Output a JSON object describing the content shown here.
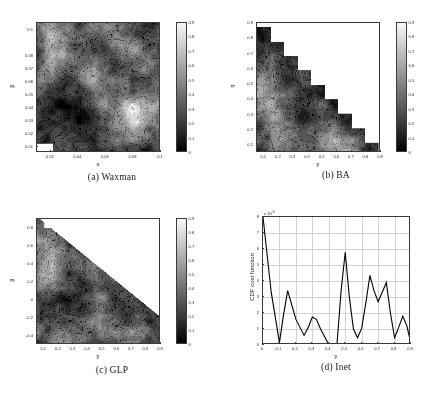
{
  "figure": {
    "panels": [
      {
        "id": "waxman",
        "caption": "(a) Waxman",
        "xlabel": "α",
        "ylabel": "β",
        "xticks": [
          "0.02",
          "0.04",
          "0.06",
          "0.08",
          "0.1"
        ],
        "xtick_values": [
          0.02,
          0.04,
          0.06,
          0.08,
          0.1
        ],
        "yticks": [
          "0.01",
          "0.02",
          "0.03",
          "0.04",
          "0.05",
          "0.06",
          "0.07",
          "0.08",
          "0.1"
        ],
        "ytick_values": [
          0.01,
          0.02,
          0.03,
          0.04,
          0.05,
          0.06,
          0.07,
          0.08,
          0.1
        ],
        "xlim": [
          0.01,
          0.1
        ],
        "ylim": [
          0.005,
          0.105
        ],
        "colorbar_ticks": [
          "0",
          "0.1",
          "0.2",
          "0.3",
          "0.4",
          "0.5",
          "0.6",
          "0.7",
          "0.8",
          "0.9"
        ],
        "colorbar_range": [
          0,
          0.9
        ]
      },
      {
        "id": "ba",
        "caption": "(b) BA",
        "xlabel": "p",
        "ylabel": "q",
        "xticks": [
          "0.1",
          "0.2",
          "0.3",
          "0.4",
          "0.5",
          "0.6",
          "0.7",
          "0.8",
          "0.9"
        ],
        "xtick_values": [
          0.1,
          0.2,
          0.3,
          0.4,
          0.5,
          0.6,
          0.7,
          0.8,
          0.9
        ],
        "yticks": [
          "0.1",
          "0.2",
          "0.3",
          "0.4",
          "0.5",
          "0.6",
          "0.7",
          "0.8",
          "0.9"
        ],
        "ytick_values": [
          0.1,
          0.2,
          0.3,
          0.4,
          0.5,
          0.6,
          0.7,
          0.8,
          0.9
        ],
        "xlim": [
          0.05,
          0.9
        ],
        "ylim": [
          0.05,
          0.9
        ],
        "colorbar_ticks": [
          "0",
          "0.1",
          "0.2",
          "0.3",
          "0.4",
          "0.5",
          "0.6",
          "0.7",
          "0.8",
          "0.9"
        ],
        "colorbar_range": [
          0,
          0.9
        ]
      },
      {
        "id": "glp",
        "caption": "(c) GLP",
        "xlabel": "p",
        "ylabel": "β",
        "xticks": [
          "0.1",
          "0.2",
          "0.3",
          "0.4",
          "0.5",
          "0.6",
          "0.7",
          "0.8",
          "0.9"
        ],
        "xtick_values": [
          0.1,
          0.2,
          0.3,
          0.4,
          0.5,
          0.6,
          0.7,
          0.8,
          0.9
        ],
        "yticks": [
          "0.8",
          "0.6",
          "0.4",
          "0.2",
          "0",
          "-0.2",
          "-0.4"
        ],
        "ytick_values": [
          0.8,
          0.6,
          0.4,
          0.2,
          0,
          -0.2,
          -0.4
        ],
        "xlim": [
          0.05,
          0.9
        ],
        "ylim": [
          -0.5,
          0.9
        ],
        "colorbar_ticks": [
          "0",
          "0.1",
          "0.2",
          "0.3",
          "0.4",
          "0.5",
          "0.6",
          "0.7",
          "0.8",
          "0.9"
        ],
        "colorbar_range": [
          0,
          0.9
        ]
      },
      {
        "id": "inet",
        "caption": "(d) Inet",
        "xlabel": "p",
        "ylabel": "CDF cost function",
        "exponent_prefix": "x 10",
        "exponent_power": "-3",
        "xticks": [
          "0",
          "0.1",
          "0.2",
          "0.3",
          "0.4",
          "0.5",
          "0.6",
          "0.7",
          "0.8",
          "0.9"
        ],
        "xtick_values": [
          0,
          0.1,
          0.2,
          0.3,
          0.4,
          0.5,
          0.6,
          0.7,
          0.8,
          0.9
        ],
        "yticks": [
          "0",
          "1",
          "2",
          "3",
          "4",
          "5",
          "6",
          "7",
          "8"
        ],
        "ytick_values": [
          0,
          1,
          2,
          3,
          4,
          5,
          6,
          7,
          8
        ],
        "xlim": [
          0,
          0.9
        ],
        "ylim": [
          0,
          8
        ]
      }
    ]
  },
  "chart_data": [
    {
      "type": "heatmap",
      "id": "waxman",
      "title": "(a) Waxman",
      "xlabel": "α",
      "ylabel": "β",
      "xlim": [
        0.01,
        0.1
      ],
      "ylim": [
        0.005,
        0.105
      ],
      "zlim": [
        0,
        0.9
      ],
      "grid": false,
      "legend": "colorbar-right",
      "x": [
        0.01,
        0.02,
        0.03,
        0.04,
        0.05,
        0.06,
        0.07,
        0.08,
        0.09,
        0.1
      ],
      "y": [
        0.01,
        0.02,
        0.03,
        0.04,
        0.05,
        0.06,
        0.07,
        0.08,
        0.09,
        0.1
      ],
      "z": [
        [
          0.05,
          0.18,
          0.3,
          0.22,
          0.16,
          0.24,
          0.4,
          0.3,
          0.2,
          0.28
        ],
        [
          0.2,
          0.28,
          0.24,
          0.18,
          0.14,
          0.22,
          0.34,
          0.46,
          0.38,
          0.3
        ],
        [
          0.32,
          0.22,
          0.14,
          0.1,
          0.18,
          0.3,
          0.52,
          0.78,
          0.62,
          0.44
        ],
        [
          0.26,
          0.16,
          0.12,
          0.14,
          0.26,
          0.42,
          0.58,
          0.86,
          0.7,
          0.52
        ],
        [
          0.34,
          0.24,
          0.2,
          0.24,
          0.44,
          0.56,
          0.42,
          0.34,
          0.48,
          0.4
        ],
        [
          0.46,
          0.38,
          0.3,
          0.36,
          0.58,
          0.48,
          0.3,
          0.26,
          0.36,
          0.32
        ],
        [
          0.38,
          0.52,
          0.44,
          0.3,
          0.4,
          0.34,
          0.24,
          0.3,
          0.44,
          0.38
        ],
        [
          0.3,
          0.62,
          0.56,
          0.38,
          0.26,
          0.3,
          0.46,
          0.56,
          0.5,
          0.34
        ],
        [
          0.42,
          0.7,
          0.48,
          0.28,
          0.34,
          0.52,
          0.62,
          0.44,
          0.3,
          0.26
        ],
        [
          0.56,
          0.58,
          0.36,
          0.24,
          0.46,
          0.66,
          0.4,
          0.28,
          0.22,
          0.3
        ]
      ]
    },
    {
      "type": "heatmap",
      "id": "ba",
      "title": "(b) BA",
      "xlabel": "p",
      "ylabel": "q",
      "xlim": [
        0.05,
        0.9
      ],
      "ylim": [
        0.05,
        0.9
      ],
      "zlim": [
        0,
        0.9
      ],
      "grid": false,
      "legend": "colorbar-right",
      "mask": "upper-triangle-blank (p+q>0.9)",
      "x": [
        0.1,
        0.2,
        0.3,
        0.4,
        0.5,
        0.6,
        0.7,
        0.8,
        0.9
      ],
      "y": [
        0.1,
        0.2,
        0.3,
        0.4,
        0.5,
        0.6,
        0.7,
        0.8,
        0.9
      ],
      "z": [
        [
          0.3,
          0.44,
          0.38,
          0.26,
          0.4,
          0.62,
          0.74,
          0.36,
          0.14
        ],
        [
          0.26,
          0.52,
          0.46,
          0.3,
          0.34,
          0.5,
          0.3,
          0.18,
          null
        ],
        [
          0.38,
          0.6,
          0.34,
          0.22,
          0.28,
          0.32,
          0.16,
          null,
          null
        ],
        [
          0.54,
          0.66,
          0.4,
          0.24,
          0.3,
          0.18,
          null,
          null,
          null
        ],
        [
          0.62,
          0.48,
          0.3,
          0.34,
          0.2,
          null,
          null,
          null,
          null
        ],
        [
          0.4,
          0.34,
          0.24,
          0.18,
          null,
          null,
          null,
          null,
          null
        ],
        [
          0.28,
          0.3,
          0.16,
          null,
          null,
          null,
          null,
          null,
          null
        ],
        [
          0.22,
          0.18,
          null,
          null,
          null,
          null,
          null,
          null,
          null
        ],
        [
          0.14,
          null,
          null,
          null,
          null,
          null,
          null,
          null,
          null
        ]
      ]
    },
    {
      "type": "heatmap",
      "id": "glp",
      "title": "(c) GLP",
      "xlabel": "p",
      "ylabel": "β",
      "xlim": [
        0.05,
        0.9
      ],
      "ylim": [
        -0.5,
        0.9
      ],
      "zlim": [
        0,
        0.9
      ],
      "grid": false,
      "legend": "colorbar-right",
      "mask": "upper-right-blank",
      "x": [
        0.1,
        0.2,
        0.3,
        0.4,
        0.5,
        0.6,
        0.7,
        0.8,
        0.9
      ],
      "y": [
        -0.4,
        -0.2,
        0,
        0.2,
        0.4,
        0.6,
        0.8
      ],
      "z": [
        [
          0.34,
          0.46,
          0.52,
          0.3,
          0.26,
          0.4,
          0.58,
          0.44,
          0.24
        ],
        [
          0.42,
          0.3,
          0.24,
          0.36,
          0.48,
          0.32,
          0.26,
          0.34,
          0.2
        ],
        [
          0.26,
          0.22,
          0.18,
          0.28,
          0.4,
          0.3,
          0.22,
          0.26,
          0.3
        ],
        [
          0.52,
          0.6,
          0.34,
          0.26,
          0.44,
          0.38,
          0.28,
          0.2,
          0.16
        ],
        [
          0.48,
          0.56,
          0.38,
          0.3,
          0.34,
          0.26,
          0.18,
          0.14,
          null
        ],
        [
          0.62,
          0.5,
          0.32,
          0.24,
          0.2,
          0.16,
          null,
          null,
          null
        ],
        [
          0.4,
          0.3,
          0.18,
          null,
          null,
          null,
          null,
          null,
          null
        ]
      ]
    },
    {
      "type": "line",
      "id": "inet",
      "title": "(d) Inet",
      "xlabel": "p",
      "ylabel": "CDF cost function",
      "y_exponent": "x 10^-3",
      "xlim": [
        0,
        0.9
      ],
      "ylim": [
        0,
        8
      ],
      "grid": true,
      "legend": "none",
      "x": [
        0.0,
        0.05,
        0.1,
        0.125,
        0.15,
        0.2,
        0.25,
        0.275,
        0.3,
        0.325,
        0.35,
        0.4,
        0.425,
        0.45,
        0.475,
        0.5,
        0.525,
        0.55,
        0.575,
        0.6,
        0.625,
        0.65,
        0.675,
        0.7,
        0.725,
        0.75,
        0.775,
        0.8,
        0.825,
        0.85,
        0.875,
        0.9
      ],
      "y": [
        8.0,
        3.3,
        0.15,
        1.9,
        3.4,
        1.6,
        0.6,
        1.1,
        1.75,
        1.6,
        1.0,
        0.02,
        0.02,
        0.05,
        3.4,
        5.8,
        3.0,
        1.0,
        0.45,
        1.05,
        2.6,
        4.35,
        3.4,
        2.7,
        3.3,
        3.9,
        2.0,
        0.45,
        1.1,
        1.8,
        1.2,
        0.05
      ]
    }
  ]
}
